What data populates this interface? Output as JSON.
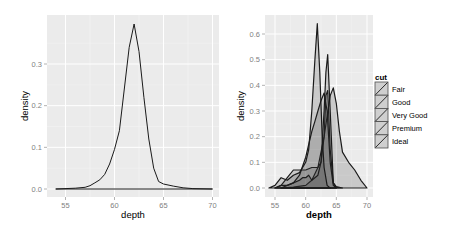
{
  "chart_data": [
    {
      "type": "line",
      "panel": "left",
      "title": "",
      "xlabel": "depth",
      "ylabel": "density",
      "xlim": [
        54,
        70
      ],
      "ylim": [
        0,
        0.4
      ],
      "x_ticks": [
        "55",
        "60",
        "65",
        "70"
      ],
      "y_ticks": [
        "0.0",
        "0.1",
        "0.2",
        "0.3"
      ],
      "grid": true,
      "series": [
        {
          "name": "all",
          "x": [
            54,
            56,
            57,
            57.5,
            58,
            58.5,
            59,
            59.5,
            60,
            60.5,
            61,
            61.5,
            62,
            62.5,
            63,
            63.5,
            64,
            64.5,
            65,
            66,
            67,
            68,
            70
          ],
          "y": [
            0,
            0.002,
            0.004,
            0.008,
            0.015,
            0.022,
            0.035,
            0.06,
            0.095,
            0.14,
            0.24,
            0.34,
            0.396,
            0.33,
            0.22,
            0.12,
            0.05,
            0.018,
            0.012,
            0.007,
            0.003,
            0.001,
            0
          ]
        }
      ]
    },
    {
      "type": "area",
      "panel": "right",
      "title": "",
      "xlabel": "depth",
      "ylabel": "density",
      "xlim": [
        54,
        70
      ],
      "ylim": [
        0,
        0.65
      ],
      "x_ticks": [
        "55",
        "60",
        "65",
        "70"
      ],
      "y_ticks": [
        "0.0",
        "0.1",
        "0.2",
        "0.3",
        "0.4",
        "0.5",
        "0.6"
      ],
      "grid": true,
      "legend": {
        "title": "cut",
        "position": "right",
        "entries": [
          "Fair",
          "Good",
          "Very Good",
          "Premium",
          "Ideal"
        ]
      },
      "series": [
        {
          "name": "Fair",
          "x": [
            56,
            58,
            60,
            61,
            62,
            63,
            64,
            64.5,
            65,
            65.5,
            66,
            67,
            68,
            69,
            70
          ],
          "y": [
            0,
            0.003,
            0.01,
            0.03,
            0.08,
            0.2,
            0.36,
            0.39,
            0.33,
            0.22,
            0.14,
            0.1,
            0.07,
            0.03,
            0
          ]
        },
        {
          "name": "Good",
          "x": [
            55,
            56,
            57,
            58,
            59,
            60,
            61,
            62,
            62.5,
            63,
            63.3,
            63.6,
            64,
            64.5,
            65,
            66
          ],
          "y": [
            0,
            0.01,
            0.04,
            0.07,
            0.07,
            0.07,
            0.08,
            0.08,
            0.1,
            0.2,
            0.36,
            0.38,
            0.15,
            0.02,
            0.005,
            0
          ]
        },
        {
          "name": "Very Good",
          "x": [
            56,
            57,
            58,
            59,
            60,
            61,
            61.5,
            62,
            62.5,
            63,
            63.5,
            64,
            64.5,
            65
          ],
          "y": [
            0,
            0.01,
            0.02,
            0.05,
            0.12,
            0.22,
            0.26,
            0.3,
            0.34,
            0.37,
            0.3,
            0.1,
            0.01,
            0
          ]
        },
        {
          "name": "Premium",
          "x": [
            55,
            56,
            57,
            58,
            59,
            59.5,
            60,
            60.5,
            61,
            61.5,
            62,
            62.5,
            63,
            63.3,
            63.6,
            64,
            64.5,
            65
          ],
          "y": [
            0,
            0.01,
            0.01,
            0.02,
            0.03,
            0.04,
            0.04,
            0.05,
            0.03,
            0.04,
            0.05,
            0.1,
            0.3,
            0.45,
            0.52,
            0.3,
            0.02,
            0
          ],
          "note": "approximate"
        },
        {
          "name": "Ideal",
          "x": [
            54,
            55,
            56,
            57,
            58,
            59,
            60,
            60.5,
            61,
            61.5,
            61.9,
            62.3,
            62.7,
            63,
            63.5,
            64
          ],
          "y": [
            0,
            0.01,
            0.04,
            0.03,
            0.05,
            0.06,
            0.1,
            0.15,
            0.3,
            0.5,
            0.64,
            0.45,
            0.2,
            0.08,
            0.01,
            0
          ]
        }
      ]
    }
  ],
  "left": {
    "ylabel": "density",
    "xlabel": "depth",
    "x_ticks": [
      "55",
      "60",
      "65",
      "70"
    ],
    "y_ticks": [
      "0.0",
      "0.1",
      "0.2",
      "0.3"
    ]
  },
  "right": {
    "ylabel": "density",
    "xlabel": "depth",
    "x_ticks": [
      "55",
      "60",
      "65",
      "70"
    ],
    "y_ticks": [
      "0.0",
      "0.1",
      "0.2",
      "0.3",
      "0.4",
      "0.5",
      "0.6"
    ],
    "legend": {
      "title": "cut",
      "entries": [
        "Fair",
        "Good",
        "Very Good",
        "Premium",
        "Ideal"
      ]
    }
  },
  "colors": {
    "panel_bg": "#ebebeb",
    "grid_major": "#ffffff",
    "grid_minor": "#f5f5f5",
    "line": "#1a1a1a",
    "fill": "#333333",
    "tick_text": "#7f7f7f"
  }
}
